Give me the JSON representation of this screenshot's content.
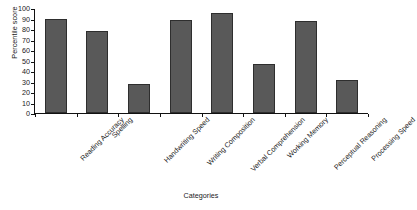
{
  "chart_data": {
    "type": "bar",
    "title": "",
    "xlabel": "Categories",
    "ylabel": "Percentile score",
    "categories": [
      "Reading Accuracy",
      "Spelling",
      "Handwriting Speed",
      "Writing Composition",
      "Verbal Comprehension",
      "Working Memory",
      "Perceptual Reasoning",
      "Processing Speed"
    ],
    "values": [
      90,
      78,
      28,
      89,
      95,
      47,
      88,
      31
    ],
    "ylim": [
      0,
      100
    ],
    "yticks": [
      0,
      10,
      20,
      30,
      40,
      50,
      60,
      70,
      80,
      90,
      100
    ],
    "ytick_labels": [
      "0",
      "10",
      "20",
      "30",
      "40",
      "50",
      "60",
      "70",
      "80",
      "90",
      "100"
    ],
    "grid": false,
    "legend": null,
    "bar_color": "#595959",
    "bar_edge_color": "#2e2e2e",
    "axis_color": "#111111",
    "background": "#ffffff"
  }
}
